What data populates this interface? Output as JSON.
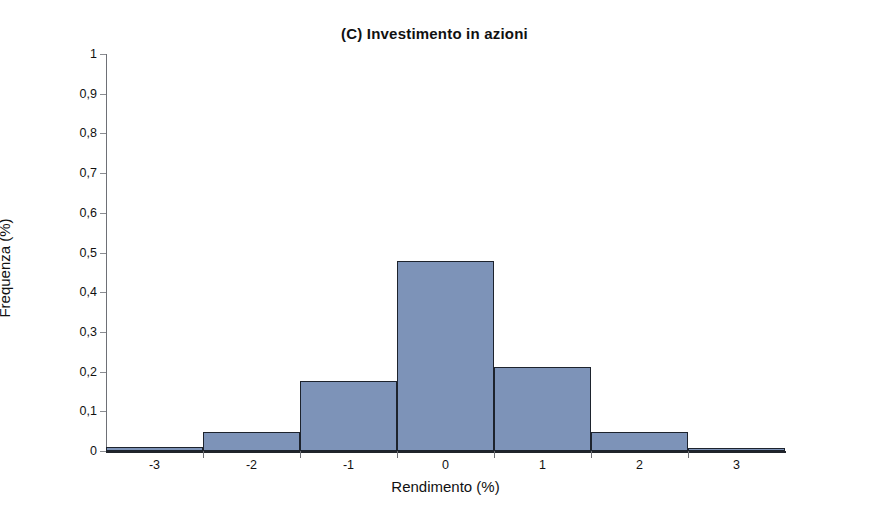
{
  "chart_data": {
    "type": "bar",
    "title": "(C) Investimento in azioni",
    "xlabel": "Rendimento (%)",
    "ylabel": "Frequenza (%)",
    "categories": [
      "-3",
      "-2",
      "-1",
      "0",
      "1",
      "2",
      "3"
    ],
    "values": [
      0.01,
      0.048,
      0.176,
      0.478,
      0.212,
      0.048,
      0.008
    ],
    "bin_edges": [
      -3.5,
      -2.5,
      -1.5,
      -0.5,
      0.5,
      1.5,
      2.5,
      3.5
    ],
    "xlim": [
      -3.5,
      3.5
    ],
    "ylim": [
      0,
      1
    ],
    "x_ticks": [
      "-3",
      "-2",
      "-1",
      "0",
      "1",
      "2",
      "3"
    ],
    "y_ticks": [
      "0",
      "0,1",
      "0,2",
      "0,3",
      "0,4",
      "0,5",
      "0,6",
      "0,7",
      "0,8",
      "0,9",
      "1"
    ],
    "y_tick_values": [
      0,
      0.1,
      0.2,
      0.3,
      0.4,
      0.5,
      0.6,
      0.7,
      0.8,
      0.9,
      1
    ],
    "grid": false,
    "legend": null,
    "decimal_separator": ",",
    "colors": {
      "bar_fill": "#7d93b8",
      "bar_edge": "#1d232d",
      "axis": "#20242b",
      "text": "#111111",
      "background": "#ffffff"
    }
  }
}
